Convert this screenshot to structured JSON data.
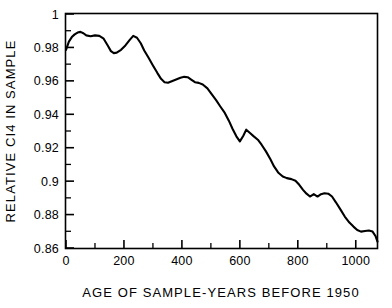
{
  "chart_data": {
    "type": "line",
    "title": "",
    "xlabel": "AGE OF SAMPLE-YEARS BEFORE  1950",
    "ylabel": "RELATIVE CI4 IN SAMPLE",
    "xlim": [
      0,
      1075
    ],
    "ylim": [
      0.86,
      1.0
    ],
    "grid": false,
    "legend": null,
    "x_major_ticks": [
      0,
      200,
      400,
      600,
      800,
      1000
    ],
    "x_tick_labels": [
      "0",
      "200",
      "400",
      "600",
      "800",
      "1000"
    ],
    "x_minor_tick_step": 100,
    "y_major_ticks": [
      0.86,
      0.88,
      0.9,
      0.92,
      0.94,
      0.96,
      0.98,
      1.0
    ],
    "y_tick_labels": [
      "0.86",
      "0.88",
      "0.9",
      "0.92",
      "0.94",
      "0.96",
      "0.98",
      "1"
    ],
    "y_minor_tick_step": 0.01,
    "line_color": "#000000",
    "line_width": 2.1,
    "series": [
      {
        "name": "Relative C14",
        "x": [
          0,
          10,
          20,
          30,
          40,
          50,
          60,
          70,
          85,
          100,
          115,
          130,
          145,
          155,
          165,
          175,
          190,
          205,
          220,
          232,
          245,
          258,
          270,
          285,
          300,
          315,
          328,
          340,
          352,
          365,
          380,
          395,
          408,
          420,
          432,
          445,
          458,
          472,
          488,
          502,
          518,
          532,
          548,
          562,
          575,
          588,
          600,
          612,
          622,
          635,
          648,
          662,
          675,
          690,
          705,
          718,
          732,
          748,
          762,
          778,
          792,
          805,
          818,
          830,
          842,
          855,
          868,
          880,
          892,
          905,
          918,
          932,
          948,
          962,
          978,
          992,
          1005,
          1018,
          1032,
          1045,
          1058,
          1068,
          1075
        ],
        "y": [
          0.9785,
          0.9835,
          0.9862,
          0.9878,
          0.9889,
          0.9893,
          0.9885,
          0.9872,
          0.9867,
          0.9872,
          0.9869,
          0.9852,
          0.9808,
          0.9778,
          0.9766,
          0.9769,
          0.9786,
          0.9812,
          0.9845,
          0.9869,
          0.9858,
          0.9825,
          0.9782,
          0.9738,
          0.9692,
          0.9648,
          0.9612,
          0.9592,
          0.9589,
          0.9598,
          0.9608,
          0.9618,
          0.9624,
          0.9622,
          0.9608,
          0.9592,
          0.9588,
          0.9578,
          0.9555,
          0.9522,
          0.9485,
          0.9448,
          0.9408,
          0.9362,
          0.9312,
          0.9268,
          0.9238,
          0.9272,
          0.9308,
          0.9288,
          0.9268,
          0.9248,
          0.9218,
          0.9178,
          0.9132,
          0.9088,
          0.9052,
          0.9028,
          0.9018,
          0.9012,
          0.9002,
          0.8978,
          0.8948,
          0.8925,
          0.8908,
          0.8922,
          0.8908,
          0.8922,
          0.8928,
          0.8925,
          0.8908,
          0.8872,
          0.8828,
          0.8788,
          0.8752,
          0.8728,
          0.8708,
          0.8698,
          0.8702,
          0.8705,
          0.8698,
          0.8672,
          0.8638
        ]
      }
    ]
  }
}
